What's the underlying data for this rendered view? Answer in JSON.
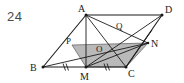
{
  "problem": {
    "number": "24"
  },
  "figure": {
    "type": "geometry-diagram",
    "background_color": "#ffffff",
    "line_color": "#1a1a1a",
    "shaded_fill_color": "#b9b9b9",
    "label_color": "#1a1a1a",
    "number_color": "#4a4a4a",
    "vertices": {
      "A": {
        "label": "A",
        "x": 86,
        "y": 15,
        "label_x": 78,
        "label_y": 12
      },
      "B": {
        "label": "B",
        "x": 43,
        "y": 67,
        "label_x": 31,
        "label_y": 71
      },
      "C": {
        "label": "C",
        "x": 126,
        "y": 67,
        "label_x": 129,
        "label_y": 76
      },
      "D": {
        "label": "D",
        "x": 162,
        "y": 15,
        "label_x": 166,
        "label_y": 13
      },
      "M": {
        "label": "M",
        "x": 86,
        "y": 67,
        "label_x": 81,
        "label_y": 80
      },
      "N": {
        "label": "N",
        "x": 148,
        "y": 43,
        "label_x": 152,
        "label_y": 47
      },
      "O": {
        "label": "O",
        "x": 100,
        "y": 49,
        "label_x": 97,
        "label_y": 50
      },
      "P": {
        "label": "P",
        "x": 72,
        "y": 45,
        "label_x": 67,
        "label_y": 43
      },
      "Q": {
        "label": "Q",
        "x": 121,
        "y": 30,
        "label_x": 117,
        "label_y": 28
      }
    },
    "segments": [
      {
        "name": "AB",
        "from": "A",
        "to": "B"
      },
      {
        "name": "BC",
        "from": "B",
        "to": "C"
      },
      {
        "name": "CD",
        "from": "C",
        "to": "D"
      },
      {
        "name": "DA",
        "from": "D",
        "to": "A"
      },
      {
        "name": "AM",
        "from": "A",
        "to": "M"
      },
      {
        "name": "AC",
        "from": "A",
        "to": "C"
      },
      {
        "name": "AN",
        "from": "A",
        "to": "N"
      },
      {
        "name": "BN",
        "from": "B",
        "to": "N"
      },
      {
        "name": "MD",
        "from": "M",
        "to": "D"
      },
      {
        "name": "CN-extended",
        "from": "C",
        "to": "D"
      },
      {
        "name": "MN",
        "from": "M",
        "to": "N"
      },
      {
        "name": "CQ",
        "from": "C",
        "to": "A"
      }
    ],
    "shaded_region": {
      "name": "shaded-parallelogram",
      "points": "72,45 148,43 126,67 86,67"
    },
    "tick_marks": [
      {
        "name": "tick-BM",
        "x": 64,
        "y": 67
      },
      {
        "name": "tick-MC",
        "x": 106,
        "y": 67
      }
    ]
  }
}
